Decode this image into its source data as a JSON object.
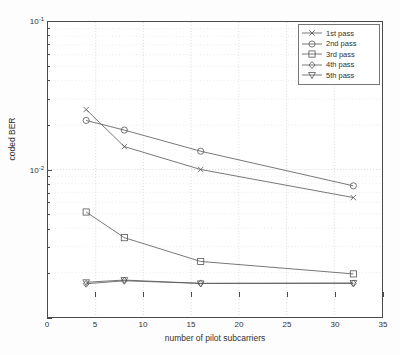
{
  "chart_data": {
    "type": "line",
    "title": "",
    "xlabel": "number of pilot subcarriers",
    "ylabel": "coded BER",
    "xlim": [
      0,
      35
    ],
    "ylim": [
      0.01,
      1
    ],
    "yscale": "log",
    "xscale": "linear",
    "grid": true,
    "legend_position": "upper right",
    "xticks": [
      "0",
      "5",
      "10",
      "15",
      "20",
      "25",
      "30",
      "35"
    ],
    "xtick_values": [
      0,
      5,
      10,
      15,
      20,
      25,
      30,
      35
    ],
    "ytick_values": [
      0.01,
      0.1,
      1
    ],
    "yticks": [
      {
        "base": "10",
        "exp": "-2"
      },
      {
        "base": "10",
        "exp": "-1"
      },
      {
        "base": "10",
        "exp": "0"
      }
    ],
    "x": [
      4,
      8,
      16,
      32
    ],
    "series": [
      {
        "name": "1st pass",
        "marker": "x",
        "values": [
          0.255,
          0.143,
          0.1,
          0.0645
        ]
      },
      {
        "name": "2nd pass",
        "marker": "circle",
        "values": [
          0.215,
          0.185,
          0.133,
          0.0775
        ]
      },
      {
        "name": "3rd pass",
        "marker": "square",
        "values": [
          0.0515,
          0.0345,
          0.0238,
          0.0196
        ]
      },
      {
        "name": "4th pass",
        "marker": "diamond",
        "values": [
          0.0168,
          0.0176,
          0.0169,
          0.0169
        ]
      },
      {
        "name": "5th pass",
        "marker": "triangle-down",
        "values": [
          0.0172,
          0.0178,
          0.0169,
          0.017
        ]
      }
    ]
  },
  "legend": {
    "entries": [
      {
        "label": "1st pass"
      },
      {
        "label": "2nd pass"
      },
      {
        "label": "3rd pass"
      },
      {
        "label": "4th pass"
      },
      {
        "label": "5th pass"
      }
    ]
  },
  "colors": {
    "line": "#555555",
    "axis": "#4a4a4a",
    "grid": "#c9c9c9",
    "background": "#ffffff"
  }
}
